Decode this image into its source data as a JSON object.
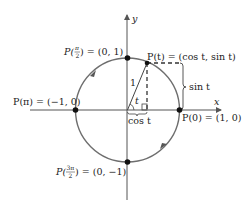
{
  "diagram": {
    "colors": {
      "axis": "#555555",
      "circle": "#6e6e6e",
      "point": "#111111",
      "text": "#222222"
    },
    "axes": {
      "x_label": "x",
      "y_label": "y"
    },
    "points": [
      {
        "id": "p-pi-over-2",
        "label": "P(π/2) = (0, 1)",
        "func": "P(",
        "arg_num": "π",
        "arg_den": "2",
        "value": ") = (0, 1)"
      },
      {
        "id": "p-pi",
        "label": "P(π) = (−1, 0)",
        "func": "P(π) = (−1, 0)"
      },
      {
        "id": "p-zero",
        "label": "P(0) = (1, 0)",
        "func": "P(0) = (1, 0)"
      },
      {
        "id": "p-3pi-over-2",
        "label": "P(3π/2) = (0, −1)",
        "func": "P(",
        "arg_num": "3π",
        "arg_den": "2",
        "value": ") = (0, −1)"
      },
      {
        "id": "p-t",
        "label": "P(t) = (cos t, sin t)",
        "func": "P(t) = (cos t, sin t)"
      }
    ],
    "annotations": {
      "radius_label": "1",
      "angle_label": "t",
      "sin_label": "sin t",
      "cos_label": "cos t"
    }
  }
}
